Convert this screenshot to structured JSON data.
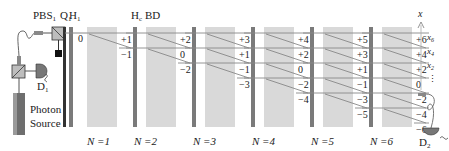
{
  "labels": {
    "pbs": "PBS",
    "pbs_sub": "1",
    "q": "Q",
    "q_sub": "1",
    "h1": "H",
    "h1_sub": "1",
    "hc": "H",
    "hc_sub": "c",
    "bd": "BD",
    "d1": "D",
    "d1_sub": "1",
    "d2": "D",
    "d2_sub": "2",
    "photon_source_line1": "Photon",
    "photon_source_line2": "Source",
    "start_position": "0",
    "axis_label": "x",
    "axis_x6": "x",
    "axis_x6_sub": "6",
    "axis_x4": "x",
    "axis_x4_sub": "4",
    "axis_x2": "x",
    "axis_x2_sub": "2",
    "axis_dots": "⋮"
  },
  "steps": [
    {
      "label": "N =1",
      "positions": [
        "+1",
        "−1"
      ]
    },
    {
      "label": "N =2",
      "positions": [
        "+2",
        "0",
        "−2"
      ]
    },
    {
      "label": "N =3",
      "positions": [
        "+3",
        "+1",
        "−1",
        "−3"
      ]
    },
    {
      "label": "N =4",
      "positions": [
        "+4",
        "+2",
        "0",
        "−2",
        "−4"
      ]
    },
    {
      "label": "N =5",
      "positions": [
        "+5",
        "+3",
        "+1",
        "−1",
        "−3",
        "−5"
      ]
    },
    {
      "label": "N =6",
      "positions": [
        "+6",
        "+4",
        "+2",
        "0",
        "−2",
        "−4",
        "−6"
      ]
    }
  ],
  "colors": {
    "bd_fill": "#d9d9d9",
    "waveplate": "#7a7a7a",
    "qwp": "#333333",
    "beam": "#888888"
  }
}
